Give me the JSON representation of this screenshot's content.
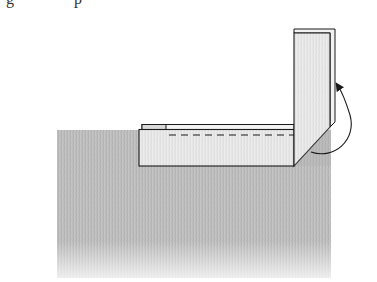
{
  "figure": {
    "caption_fragment": "g p",
    "elements": {
      "surface": {
        "label": "shaded-surface",
        "color": "#b8b8b8"
      },
      "horizontal_flap": {
        "label": "horizontal-flap",
        "has_dashed_fold_line": true
      },
      "vertical_flap": {
        "label": "vertical-flap"
      },
      "arrow": {
        "label": "fold-up-arrow",
        "direction": "counterclockwise-up"
      }
    },
    "colors": {
      "stroke": "#1a1a1a",
      "panel_fill": "#e6e6e6",
      "surface_fill": "#bdbdbd"
    }
  }
}
